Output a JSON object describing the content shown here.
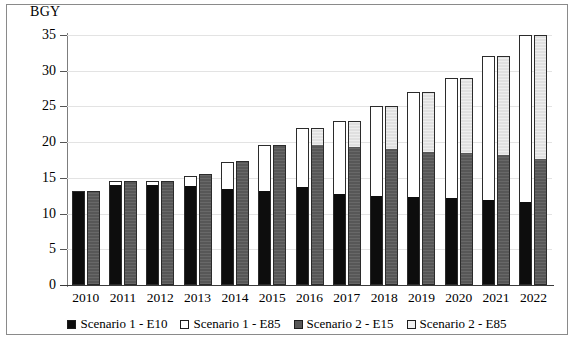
{
  "chart_data": {
    "type": "bar",
    "subtype": "grouped-stacked-bar",
    "title": "",
    "xlabel": "",
    "ylabel": "BGY",
    "ylim": [
      0,
      35
    ],
    "yticks": [
      0,
      5,
      10,
      15,
      20,
      25,
      30,
      35
    ],
    "grid": true,
    "legend_position": "bottom",
    "categories": [
      "2010",
      "2011",
      "2012",
      "2013",
      "2014",
      "2015",
      "2016",
      "2017",
      "2018",
      "2019",
      "2020",
      "2021",
      "2022"
    ],
    "series": [
      {
        "name": "Scenario 1 -  E10",
        "group": "Scenario 1",
        "stack": "scenario1",
        "color": "#0d0d0d",
        "values": [
          13.1,
          14.1,
          14.1,
          14.0,
          13.5,
          13.2,
          13.7,
          12.8,
          12.5,
          12.3,
          12.1,
          11.9,
          11.6
        ]
      },
      {
        "name": "Scenario 1 - E85",
        "group": "Scenario 1",
        "stack": "scenario1",
        "color": "#ffffff",
        "values": [
          0.0,
          0.4,
          0.4,
          1.3,
          3.7,
          6.4,
          8.3,
          10.2,
          12.5,
          14.7,
          16.9,
          20.1,
          23.4
        ]
      },
      {
        "name": "Scenario 2 - E15",
        "group": "Scenario 2",
        "stack": "scenario2",
        "color": "#575757",
        "values": [
          13.1,
          14.6,
          14.6,
          15.5,
          17.3,
          19.6,
          19.7,
          19.4,
          19.1,
          18.7,
          18.5,
          18.2,
          17.7
        ]
      },
      {
        "name": "Scenario 2 - E85",
        "group": "Scenario 2",
        "stack": "scenario2",
        "color": "#e0e0e0",
        "values": [
          0.0,
          0.0,
          0.0,
          0.0,
          0.0,
          0.0,
          2.3,
          3.6,
          5.9,
          8.3,
          10.5,
          13.8,
          17.3
        ]
      }
    ],
    "totals": {
      "scenario1": [
        13.1,
        14.5,
        14.5,
        15.3,
        17.2,
        19.6,
        22.0,
        23.0,
        25.0,
        27.0,
        29.0,
        32.0,
        35.0
      ],
      "scenario2": [
        13.1,
        14.6,
        14.6,
        15.5,
        17.3,
        19.6,
        22.0,
        23.0,
        25.0,
        27.0,
        29.0,
        32.0,
        35.0
      ]
    }
  },
  "legend": {
    "items": [
      {
        "label": "Scenario 1 -  E10",
        "swatch": "black-square-icon"
      },
      {
        "label": "Scenario 1 - E85",
        "swatch": "white-square-icon"
      },
      {
        "label": "Scenario 2 - E15",
        "swatch": "gray-square-icon"
      },
      {
        "label": "Scenario 2 - E85",
        "swatch": "light-gray-square-icon"
      }
    ]
  }
}
